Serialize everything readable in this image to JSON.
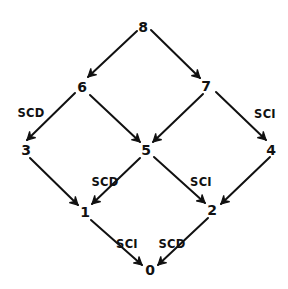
{
  "diagram": {
    "type": "directed-lattice",
    "colors": {
      "ink": "#111111",
      "background": "#ffffff"
    },
    "nodes": [
      {
        "id": "8",
        "label": "8",
        "x": 143,
        "y": 28
      },
      {
        "id": "6",
        "label": "6",
        "x": 82,
        "y": 88
      },
      {
        "id": "7",
        "label": "7",
        "x": 206,
        "y": 87
      },
      {
        "id": "3",
        "label": "3",
        "x": 26,
        "y": 151
      },
      {
        "id": "5",
        "label": "5",
        "x": 146,
        "y": 151
      },
      {
        "id": "4",
        "label": "4",
        "x": 271,
        "y": 151
      },
      {
        "id": "1",
        "label": "1",
        "x": 85,
        "y": 213
      },
      {
        "id": "2",
        "label": "2",
        "x": 212,
        "y": 211
      },
      {
        "id": "0",
        "label": "0",
        "x": 150,
        "y": 271
      }
    ],
    "edges": [
      {
        "from": "8",
        "to": "6",
        "label": "",
        "x1": 137,
        "y1": 31,
        "x2": 88,
        "y2": 77
      },
      {
        "from": "8",
        "to": "7",
        "label": "",
        "x1": 151,
        "y1": 30,
        "x2": 200,
        "y2": 78
      },
      {
        "from": "6",
        "to": "3",
        "label": "SCD",
        "x1": 75,
        "y1": 93,
        "x2": 27,
        "y2": 140
      },
      {
        "from": "6",
        "to": "5",
        "label": "",
        "x1": 90,
        "y1": 95,
        "x2": 140,
        "y2": 142
      },
      {
        "from": "7",
        "to": "5",
        "label": "",
        "x1": 203,
        "y1": 94,
        "x2": 153,
        "y2": 142
      },
      {
        "from": "7",
        "to": "4",
        "label": "SCI",
        "x1": 216,
        "y1": 92,
        "x2": 266,
        "y2": 140
      },
      {
        "from": "3",
        "to": "1",
        "label": "",
        "x1": 30,
        "y1": 158,
        "x2": 78,
        "y2": 205
      },
      {
        "from": "5",
        "to": "1",
        "label": "SCD",
        "x1": 140,
        "y1": 158,
        "x2": 92,
        "y2": 204
      },
      {
        "from": "5",
        "to": "2",
        "label": "SCI",
        "x1": 154,
        "y1": 157,
        "x2": 205,
        "y2": 203
      },
      {
        "from": "4",
        "to": "2",
        "label": "",
        "x1": 270,
        "y1": 157,
        "x2": 221,
        "y2": 204
      },
      {
        "from": "1",
        "to": "0",
        "label": "SCI",
        "x1": 91,
        "y1": 220,
        "x2": 142,
        "y2": 265
      },
      {
        "from": "2",
        "to": "0",
        "label": "SCD",
        "x1": 208,
        "y1": 218,
        "x2": 158,
        "y2": 265
      }
    ],
    "edge_labels": [
      {
        "text": "SCD",
        "x": 31,
        "y": 113,
        "edge": "6-3"
      },
      {
        "text": "SCI",
        "x": 265,
        "y": 114,
        "edge": "7-4"
      },
      {
        "text": "SCD",
        "x": 105,
        "y": 182,
        "edge": "5-1"
      },
      {
        "text": "SCI",
        "x": 201,
        "y": 182,
        "edge": "5-2"
      },
      {
        "text": "SCI",
        "x": 127,
        "y": 244,
        "edge": "1-0"
      },
      {
        "text": "SCD",
        "x": 172,
        "y": 244,
        "edge": "2-0"
      }
    ]
  }
}
